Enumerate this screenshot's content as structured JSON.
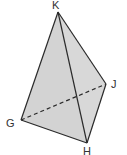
{
  "diagram": {
    "type": "tetrahedron",
    "fill_color": "#d3d3d3",
    "stroke_color": "#2a2a2a",
    "vertices": {
      "K": {
        "label": "K",
        "x": 58,
        "y": 12
      },
      "J": {
        "label": "J",
        "x": 106,
        "y": 84
      },
      "G": {
        "label": "G",
        "x": 21,
        "y": 120
      },
      "H": {
        "label": "H",
        "x": 87,
        "y": 143
      }
    },
    "edges_solid": [
      "K-G",
      "K-H",
      "K-J",
      "G-H",
      "H-J"
    ],
    "edges_hidden": [
      "G-J"
    ]
  }
}
